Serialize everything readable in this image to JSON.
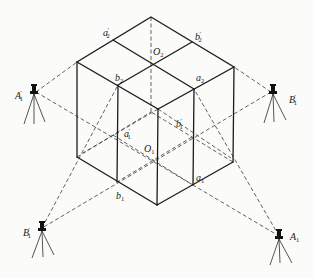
{
  "figure": {
    "type": "isometric block with survey instruments",
    "labels": {
      "a2p": {
        "base": "a",
        "sub": "2",
        "prime": true
      },
      "b2p": {
        "base": "b",
        "sub": "2",
        "prime": true
      },
      "O2": {
        "base": "O",
        "sub": "2",
        "prime": false
      },
      "b2": {
        "base": "b",
        "sub": "2",
        "prime": false
      },
      "a2": {
        "base": "a",
        "sub": "2",
        "prime": false
      },
      "a1p": {
        "base": "a",
        "sub": "1",
        "prime": true
      },
      "b1p": {
        "base": "b",
        "sub": "1",
        "prime": true
      },
      "O1": {
        "base": "O",
        "sub": "1",
        "prime": false
      },
      "b1": {
        "base": "b",
        "sub": "1",
        "prime": false
      },
      "a1": {
        "base": "a",
        "sub": "1",
        "prime": false
      }
    },
    "instruments": [
      {
        "id": "A1p",
        "base": "A",
        "sub": "1",
        "prime": true,
        "icon": "theodolite-on-tripod"
      },
      {
        "id": "B1p_right",
        "base": "B",
        "sub": "1",
        "prime": true,
        "icon": "theodolite-on-tripod"
      },
      {
        "id": "B1p_left",
        "base": "B",
        "sub": "1",
        "prime": true,
        "icon": "theodolite-on-tripod"
      },
      {
        "id": "A1",
        "base": "A",
        "sub": "1",
        "prime": false,
        "icon": "theodolite-on-tripod"
      }
    ],
    "text": {
      "a": "a",
      "b": "b",
      "O": "O",
      "A": "A",
      "B": "B",
      "s1": "1",
      "s2": "2",
      "prime": "′"
    }
  }
}
